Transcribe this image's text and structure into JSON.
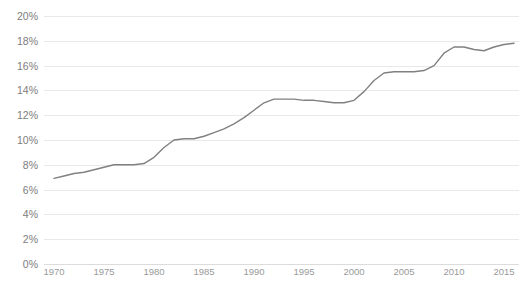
{
  "chart_data": {
    "type": "line",
    "title": "",
    "subtitle": "",
    "xlabel": "",
    "ylabel": "",
    "xlim": [
      1969,
      2016.5
    ],
    "ylim": [
      0,
      20
    ],
    "grid": true,
    "legend": false,
    "y_tick_labels": [
      "20%",
      "18%",
      "16%",
      "14%",
      "12%",
      "10%",
      "8%",
      "6%",
      "4%",
      "2%",
      "0%"
    ],
    "y_ticks": [
      20,
      18,
      16,
      14,
      12,
      10,
      8,
      6,
      4,
      2,
      0
    ],
    "x_tick_labels": [
      "1970",
      "1975",
      "1980",
      "1985",
      "1990",
      "1995",
      "2000",
      "2005",
      "2010",
      "2015"
    ],
    "x_ticks": [
      1970,
      1975,
      1980,
      1985,
      1990,
      1995,
      2000,
      2005,
      2010,
      2015
    ],
    "series": [
      {
        "name": "",
        "color": "#808080",
        "x": [
          1970,
          1971,
          1972,
          1973,
          1974,
          1975,
          1976,
          1977,
          1978,
          1979,
          1980,
          1981,
          1982,
          1983,
          1984,
          1985,
          1986,
          1987,
          1988,
          1989,
          1990,
          1991,
          1992,
          1993,
          1994,
          1995,
          1996,
          1997,
          1998,
          1999,
          2000,
          2001,
          2002,
          2003,
          2004,
          2005,
          2006,
          2007,
          2008,
          2009,
          2010,
          2011,
          2012,
          2013,
          2014,
          2015,
          2016
        ],
        "values": [
          6.9,
          7.1,
          7.3,
          7.4,
          7.6,
          7.8,
          8.0,
          8.0,
          8.0,
          8.1,
          8.6,
          9.4,
          10.0,
          10.1,
          10.1,
          10.3,
          10.6,
          10.9,
          11.3,
          11.8,
          12.4,
          13.0,
          13.3,
          13.3,
          13.3,
          13.2,
          13.2,
          13.1,
          13.0,
          13.0,
          13.2,
          13.9,
          14.8,
          15.4,
          15.5,
          15.5,
          15.5,
          15.6,
          16.0,
          17.0,
          17.5,
          17.5,
          17.3,
          17.2,
          17.5,
          17.7,
          17.8
        ]
      }
    ]
  },
  "axis": {
    "y_unit": "%",
    "x_unit": "year"
  }
}
